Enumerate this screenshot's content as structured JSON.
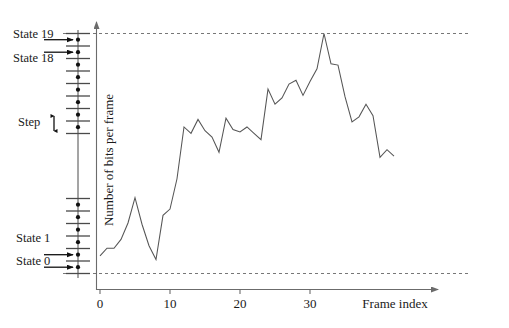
{
  "figure": {
    "title": "",
    "background_color": "#ffffff",
    "line_color": "#555555",
    "axis_color": "#6b6b6b",
    "dashed_color": "#777777",
    "marker_color": "#111111"
  },
  "axes": {
    "xlabel": "Frame index",
    "ylabel": "Number of bits per frame",
    "xticks": [
      "0",
      "10",
      "20",
      "30"
    ],
    "xtick_values": [
      0,
      10,
      20,
      30
    ],
    "xlim": [
      -1,
      43
    ],
    "yticks": [],
    "grid": false
  },
  "annotations": {
    "step_label": "Step",
    "state_labels": [
      {
        "text": "State 19",
        "state": 19
      },
      {
        "text": "State 18",
        "state": 18
      },
      {
        "text": "State 1",
        "state": 1
      },
      {
        "text": "State 0",
        "state": 0
      }
    ],
    "state_axis_caption": "quantization state scale",
    "dashed_line_top_caption": "maximum level at State 19",
    "dashed_line_bottom_caption": "minimum level at State 0"
  },
  "chart_data": {
    "type": "line",
    "title": "",
    "xlabel": "Frame index",
    "ylabel": "Number of bits per frame",
    "xlim": [
      -1,
      43
    ],
    "ylim": [
      0,
      19
    ],
    "grid": false,
    "legend": null,
    "x": [
      0,
      1,
      2,
      3,
      4,
      5,
      6,
      7,
      8,
      9,
      10,
      11,
      12,
      13,
      14,
      15,
      16,
      17,
      18,
      19,
      20,
      21,
      22,
      23,
      24,
      25,
      26,
      27,
      28,
      29,
      30,
      31,
      32,
      33,
      34,
      35,
      36,
      37,
      38,
      39,
      40,
      41,
      42
    ],
    "values": [
      1.4,
      2.0,
      2.0,
      2.7,
      4.0,
      6.0,
      3.9,
      2.2,
      1.1,
      4.6,
      5.1,
      7.5,
      11.6,
      11.1,
      12.2,
      11.3,
      10.8,
      9.6,
      12.3,
      11.4,
      11.2,
      11.6,
      11.1,
      10.6,
      14.6,
      13.4,
      13.9,
      15.0,
      15.3,
      14.1,
      15.2,
      16.2,
      19.0,
      16.6,
      16.5,
      14.0,
      12.0,
      12.4,
      13.4,
      12.5,
      9.2,
      9.8,
      9.3
    ],
    "series_note": "continuous polyline, no markers",
    "state_scale": {
      "min_state": 0,
      "max_state": 19,
      "step_count": 19,
      "step_label": "Step"
    }
  }
}
